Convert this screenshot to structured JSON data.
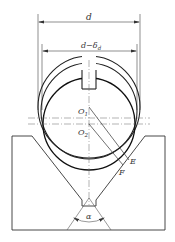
{
  "diagram": {
    "labels": {
      "d": "d",
      "d_minus_delta": "d−δ",
      "delta_sub": "d",
      "O1": "O",
      "O1_sub": "1",
      "O2": "O",
      "O2_sub": "2",
      "E": "E",
      "F": "F",
      "alpha": "α"
    },
    "colors": {
      "line": "#2a2a2a",
      "thin": "#555555",
      "background": "#ffffff"
    }
  }
}
